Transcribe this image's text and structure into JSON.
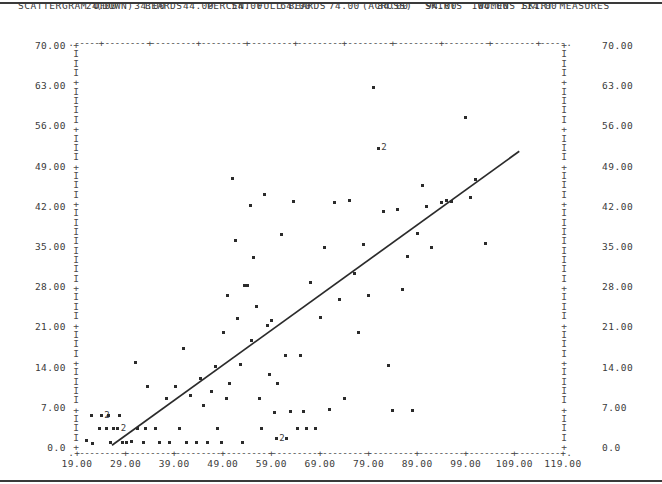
{
  "header": {
    "title_prefix": "SCATTERGRAM OF",
    "down_marker": "(DOWN)",
    "down_var": "BEARDS",
    "down_desc": "PERCENT FULL BEARDS",
    "across_marker": "(ACROSS)",
    "across_var": "SKIRTS",
    "across_desc": "WOMENS SKIRT MEASURES"
  },
  "chart_data": {
    "type": "scatter",
    "title": "SCATTERGRAM OF   (DOWN) BEARDS   PERCENT FULL BEARDS      (ACROSS) SKIRTS   WOMENS SKIRT MEASURES",
    "xlabel": "SKIRTS  WOMENS SKIRT MEASURES",
    "ylabel": "BEARDS  PERCENT FULL BEARDS",
    "xlim": [
      19.0,
      119.0
    ],
    "ylim": [
      0.0,
      70.0
    ],
    "grid": false,
    "legend": "none",
    "x_ticks_bottom": [
      "19.00",
      "29.00",
      "39.00",
      "49.00",
      "59.00",
      "69.00",
      "79.00",
      "89.00",
      "99.00",
      "109.00",
      "119.00"
    ],
    "x_ticks_bottom_values": [
      19,
      29,
      39,
      49,
      59,
      69,
      79,
      89,
      99,
      109,
      119
    ],
    "x_ticks_top": [
      "24.00",
      "34.00",
      "44.00",
      "54.00",
      "64.00",
      "74.00",
      "84.00",
      "94.00",
      "104.00",
      "114.00"
    ],
    "x_ticks_top_values": [
      24,
      34,
      44,
      54,
      64,
      74,
      84,
      94,
      104,
      114
    ],
    "y_ticks": [
      "0.0",
      "7.00",
      "14.00",
      "21.00",
      "28.00",
      "35.00",
      "42.00",
      "49.00",
      "56.00",
      "63.00",
      "70.00"
    ],
    "y_ticks_values": [
      0,
      7,
      14,
      21,
      28,
      35,
      42,
      49,
      56,
      63,
      70
    ],
    "marker_glyph": "*",
    "overlap_glyph": "2",
    "overlap_note": "digit 2 marks two coincident observations",
    "regression_line": {
      "x0": 26.2,
      "y0": 0.3,
      "x1": 110.0,
      "y1": 51.5
    },
    "points": [
      {
        "x": 21.0,
        "y": 1.2
      },
      {
        "x": 22.2,
        "y": 0.6
      },
      {
        "x": 22.0,
        "y": 5.4
      },
      {
        "x": 23.6,
        "y": 3.2
      },
      {
        "x": 24.0,
        "y": 5.4,
        "n": 2
      },
      {
        "x": 25.5,
        "y": 5.4
      },
      {
        "x": 25.0,
        "y": 3.2
      },
      {
        "x": 25.8,
        "y": 0.7
      },
      {
        "x": 26.6,
        "y": 3.2
      },
      {
        "x": 27.4,
        "y": 3.2,
        "n": 2
      },
      {
        "x": 27.8,
        "y": 5.4
      },
      {
        "x": 28.4,
        "y": 0.7
      },
      {
        "x": 29.2,
        "y": 0.7
      },
      {
        "x": 30.2,
        "y": 1.0
      },
      {
        "x": 31.0,
        "y": 14.8
      },
      {
        "x": 31.4,
        "y": 3.2
      },
      {
        "x": 32.6,
        "y": 0.7
      },
      {
        "x": 33.0,
        "y": 3.2
      },
      {
        "x": 33.6,
        "y": 10.6
      },
      {
        "x": 35.2,
        "y": 3.2
      },
      {
        "x": 36.0,
        "y": 0.7
      },
      {
        "x": 37.4,
        "y": 8.4
      },
      {
        "x": 38.0,
        "y": 0.7
      },
      {
        "x": 39.2,
        "y": 10.6
      },
      {
        "x": 40.0,
        "y": 3.2
      },
      {
        "x": 41.0,
        "y": 17.2
      },
      {
        "x": 41.6,
        "y": 0.7
      },
      {
        "x": 42.4,
        "y": 9.0
      },
      {
        "x": 43.6,
        "y": 0.7
      },
      {
        "x": 44.4,
        "y": 12.0
      },
      {
        "x": 45.0,
        "y": 7.2
      },
      {
        "x": 45.8,
        "y": 0.7
      },
      {
        "x": 46.6,
        "y": 9.6
      },
      {
        "x": 47.4,
        "y": 14.0
      },
      {
        "x": 48.0,
        "y": 3.2
      },
      {
        "x": 48.8,
        "y": 0.7
      },
      {
        "x": 49.2,
        "y": 20.0
      },
      {
        "x": 49.8,
        "y": 8.4
      },
      {
        "x": 50.4,
        "y": 11.0
      },
      {
        "x": 50.0,
        "y": 26.4
      },
      {
        "x": 51.0,
        "y": 46.8
      },
      {
        "x": 51.6,
        "y": 36.0
      },
      {
        "x": 52.0,
        "y": 22.4
      },
      {
        "x": 52.6,
        "y": 14.4
      },
      {
        "x": 53.0,
        "y": 0.7
      },
      {
        "x": 53.4,
        "y": 28.2
      },
      {
        "x": 54.0,
        "y": 28.2
      },
      {
        "x": 54.6,
        "y": 42.0
      },
      {
        "x": 55.0,
        "y": 18.6
      },
      {
        "x": 55.4,
        "y": 33.0
      },
      {
        "x": 56.0,
        "y": 24.4
      },
      {
        "x": 56.6,
        "y": 8.4
      },
      {
        "x": 57.0,
        "y": 3.2
      },
      {
        "x": 57.6,
        "y": 44.0
      },
      {
        "x": 58.2,
        "y": 21.2
      },
      {
        "x": 58.6,
        "y": 12.6
      },
      {
        "x": 59.0,
        "y": 22.0
      },
      {
        "x": 59.6,
        "y": 6.0
      },
      {
        "x": 60.2,
        "y": 11.0
      },
      {
        "x": 60.0,
        "y": 1.4,
        "n": 2
      },
      {
        "x": 61.0,
        "y": 37.0
      },
      {
        "x": 61.8,
        "y": 16.0
      },
      {
        "x": 62.2,
        "y": 1.4
      },
      {
        "x": 63.0,
        "y": 6.2
      },
      {
        "x": 63.6,
        "y": 42.8
      },
      {
        "x": 64.4,
        "y": 3.2
      },
      {
        "x": 65.0,
        "y": 16.0
      },
      {
        "x": 65.6,
        "y": 6.2
      },
      {
        "x": 66.2,
        "y": 3.2
      },
      {
        "x": 67.0,
        "y": 28.6
      },
      {
        "x": 68.0,
        "y": 3.2
      },
      {
        "x": 69.0,
        "y": 22.6
      },
      {
        "x": 70.0,
        "y": 34.8
      },
      {
        "x": 71.0,
        "y": 6.6
      },
      {
        "x": 72.0,
        "y": 42.6
      },
      {
        "x": 73.0,
        "y": 25.6
      },
      {
        "x": 74.0,
        "y": 8.4
      },
      {
        "x": 75.0,
        "y": 43.0
      },
      {
        "x": 76.0,
        "y": 30.2
      },
      {
        "x": 77.0,
        "y": 20.0
      },
      {
        "x": 78.0,
        "y": 35.2
      },
      {
        "x": 79.0,
        "y": 26.4
      },
      {
        "x": 80.0,
        "y": 62.6
      },
      {
        "x": 81.0,
        "y": 52.0,
        "n": 2
      },
      {
        "x": 82.0,
        "y": 41.0
      },
      {
        "x": 83.0,
        "y": 14.2
      },
      {
        "x": 84.0,
        "y": 6.4
      },
      {
        "x": 85.0,
        "y": 41.4
      },
      {
        "x": 86.0,
        "y": 27.4
      },
      {
        "x": 87.0,
        "y": 33.2
      },
      {
        "x": 88.0,
        "y": 6.4
      },
      {
        "x": 89.0,
        "y": 37.2
      },
      {
        "x": 90.0,
        "y": 45.6
      },
      {
        "x": 91.0,
        "y": 41.8
      },
      {
        "x": 92.0,
        "y": 34.8
      },
      {
        "x": 94.0,
        "y": 42.6
      },
      {
        "x": 95.0,
        "y": 43.0
      },
      {
        "x": 96.0,
        "y": 42.8
      },
      {
        "x": 99.0,
        "y": 57.4
      },
      {
        "x": 100.0,
        "y": 43.4
      },
      {
        "x": 101.0,
        "y": 46.6
      },
      {
        "x": 103.0,
        "y": 35.4
      }
    ]
  }
}
